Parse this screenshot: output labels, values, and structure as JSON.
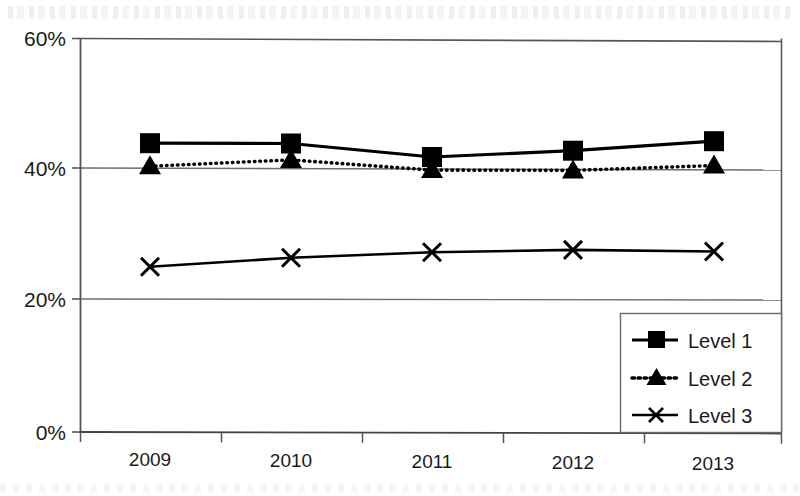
{
  "chart_data": {
    "type": "line",
    "title": "",
    "subtitle": "",
    "xlabel": "",
    "ylabel": "",
    "categories": [
      "2009",
      "2010",
      "2011",
      "2012",
      "2013"
    ],
    "x": [
      2009,
      2010,
      2011,
      2012,
      2013
    ],
    "ylim": [
      0,
      60
    ],
    "yticks": [
      0,
      20,
      40,
      60
    ],
    "ytick_labels": [
      "0%",
      "20%",
      "40%",
      "60%"
    ],
    "grid": true,
    "grid_axis": "y",
    "legend_position": "bottom-right",
    "legend_border": true,
    "series": [
      {
        "name": "Level 1",
        "values": [
          44.0,
          44.0,
          42.0,
          43.0,
          44.5
        ],
        "marker": "square",
        "linestyle": "solid",
        "color": "#000000"
      },
      {
        "name": "Level 2",
        "values": [
          40.5,
          41.5,
          40.0,
          40.0,
          40.8
        ],
        "marker": "triangle",
        "linestyle": "dotted",
        "color": "#000000"
      },
      {
        "name": "Level 3",
        "values": [
          25.2,
          26.6,
          27.5,
          27.9,
          27.7
        ],
        "marker": "x",
        "linestyle": "solid",
        "color": "#000000"
      }
    ]
  },
  "axis": {
    "y_tick_0": "0%",
    "y_tick_1": "20%",
    "y_tick_2": "40%",
    "y_tick_3": "60%",
    "x_tick_0": "2009",
    "x_tick_1": "2010",
    "x_tick_2": "2011",
    "x_tick_3": "2012",
    "x_tick_4": "2013"
  },
  "legend": {
    "items": [
      {
        "label": "Level 1",
        "marker": "square",
        "linestyle": "solid"
      },
      {
        "label": "Level 2",
        "marker": "triangle",
        "linestyle": "dotted"
      },
      {
        "label": "Level 3",
        "marker": "x",
        "linestyle": "solid"
      }
    ]
  },
  "colors": {
    "ink": "#111111",
    "axis": "#555555",
    "grid": "#8a8a8a",
    "background": "#ffffff"
  }
}
